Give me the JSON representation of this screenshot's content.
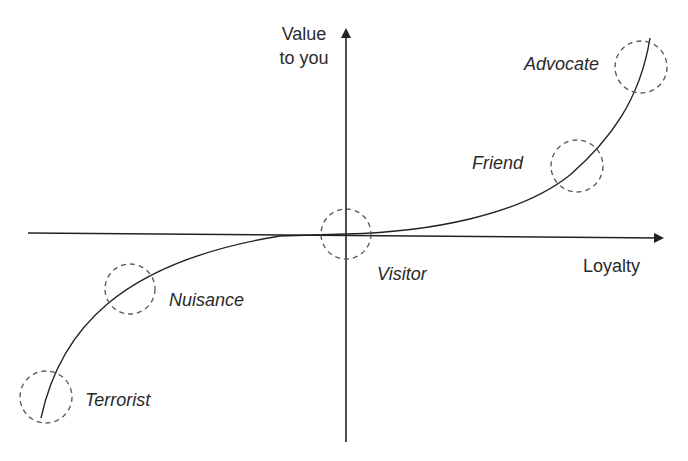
{
  "diagram": {
    "axes": {
      "x_label": "Loyalty",
      "y_label_line1": "Value",
      "y_label_line2": "to you"
    },
    "stages": [
      {
        "id": "terrorist",
        "label": "Terrorist"
      },
      {
        "id": "nuisance",
        "label": "Nuisance"
      },
      {
        "id": "visitor",
        "label": "Visitor"
      },
      {
        "id": "friend",
        "label": "Friend"
      },
      {
        "id": "advocate",
        "label": "Advocate"
      }
    ],
    "colors": {
      "line": "#222222",
      "circle": "#555555",
      "text": "#2a2a2a"
    }
  }
}
